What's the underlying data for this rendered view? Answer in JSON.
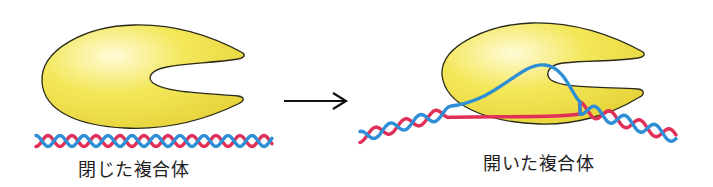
{
  "diagram": {
    "colors": {
      "enzyme_fill_light": "#fffbd8",
      "enzyme_fill": "#f3e75a",
      "enzyme_fill_dark": "#e6d238",
      "enzyme_outline": "#2a2a1a",
      "strand_blue": "#2f8fd6",
      "strand_red": "#e03058",
      "arrow": "#111111",
      "background": "#ffffff"
    },
    "states": [
      {
        "id": "closed",
        "label": "閉じた複合体",
        "enzyme_icon": "enzyme-pacman-shape",
        "dna": "double-helix-intact"
      },
      {
        "id": "open",
        "label": "開いた複合体",
        "enzyme_icon": "enzyme-pacman-shape",
        "dna": "double-helix-with-melted-bubble"
      }
    ],
    "transition": {
      "icon": "right-arrow-icon",
      "from": "closed",
      "to": "open"
    }
  }
}
